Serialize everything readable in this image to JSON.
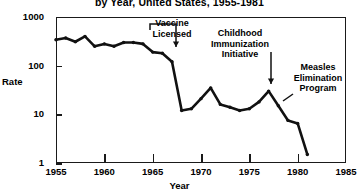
{
  "title": {
    "line_visible": "by Year, United States, 1955-1981"
  },
  "axes": {
    "x_title": "Year",
    "y_title": "Rate",
    "x_ticks": [
      "1955",
      "1960",
      "1965",
      "1970",
      "1975",
      "1980",
      "1985"
    ],
    "y_ticks": [
      "1000",
      "100",
      "10",
      "1"
    ]
  },
  "annotations": {
    "vaccine": "Vaccine Licensed",
    "childhood": "Childhood Immunization Initiative",
    "measles": "Measles Elimination Program"
  },
  "colors": {
    "axis": "#1a1a1a",
    "series": "#111111",
    "background": "#ffffff"
  },
  "chart_data": {
    "type": "line",
    "title": "by Year, United States, 1955-1981",
    "xlabel": "Year",
    "ylabel": "Rate",
    "yscale": "log",
    "ylim": [
      1,
      1000
    ],
    "xlim": [
      1955,
      1985
    ],
    "grid": false,
    "legend": null,
    "x": [
      1955,
      1956,
      1957,
      1958,
      1959,
      1960,
      1961,
      1962,
      1963,
      1964,
      1965,
      1966,
      1967,
      1968,
      1969,
      1970,
      1971,
      1972,
      1973,
      1974,
      1975,
      1976,
      1977,
      1978,
      1979,
      1980,
      1981
    ],
    "values": [
      340,
      370,
      310,
      400,
      250,
      280,
      250,
      300,
      300,
      280,
      190,
      180,
      120,
      12,
      13,
      21,
      35,
      16,
      14,
      12,
      13,
      18,
      30,
      15,
      7.5,
      6.5,
      1.5
    ],
    "series": [
      {
        "name": "Measles rate per 100,000",
        "values": [
          340,
          370,
          310,
          400,
          250,
          280,
          250,
          300,
          300,
          280,
          190,
          180,
          120,
          12,
          13,
          21,
          35,
          16,
          14,
          12,
          13,
          18,
          30,
          15,
          7.5,
          6.5,
          1.5
        ]
      }
    ],
    "annotations": [
      {
        "text": "Vaccine Licensed",
        "x": 1963
      },
      {
        "text": "Childhood Immunization Initiative",
        "x": 1977
      },
      {
        "text": "Measles Elimination Program",
        "x": 1978
      }
    ]
  }
}
